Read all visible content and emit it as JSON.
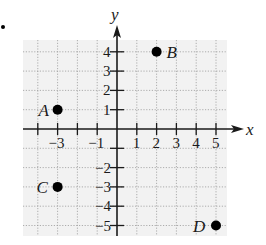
{
  "chart_data": {
    "type": "scatter",
    "title": "",
    "xlabel": "x",
    "ylabel": "y",
    "xlim": [
      -5,
      5
    ],
    "ylim": [
      -5,
      4
    ],
    "grid": true,
    "x_tick_labels": [
      "-3",
      "-1",
      "1",
      "2",
      "3",
      "4",
      "5"
    ],
    "y_tick_labels": [
      "4",
      "3",
      "2",
      "1",
      "-2",
      "-3",
      "-4",
      "-5"
    ],
    "points": [
      {
        "label": "A",
        "x": -3,
        "y": 1
      },
      {
        "label": "B",
        "x": 2,
        "y": 4
      },
      {
        "label": "C",
        "x": -3,
        "y": -3
      },
      {
        "label": "D",
        "x": 5,
        "y": -5
      }
    ]
  },
  "colors": {
    "grid_bg": "#f2f2f2",
    "grid_line": "#9a9a9a",
    "axis": "#1a1a1a",
    "point": "#000000"
  }
}
